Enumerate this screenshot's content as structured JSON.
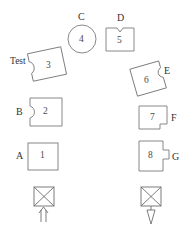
{
  "diagram": {
    "type": "schematic-block-diagram",
    "canvas": {
      "width": 188,
      "height": 229
    },
    "stroke_color": "#7a7a7a",
    "text_color": "#3a3a3a",
    "background_color": "#ffffff",
    "shapes": [
      {
        "id": "shape-1",
        "number": "1",
        "form": "square",
        "label": "A",
        "label_position": "left",
        "x": 28,
        "y": 143,
        "width": 30,
        "height": 27
      },
      {
        "id": "shape-2",
        "number": "2",
        "form": "rect-with-left-round-notch",
        "label": "B",
        "label_position": "left",
        "x": 28,
        "y": 98,
        "width": 34,
        "height": 28
      },
      {
        "id": "shape-3",
        "number": "3",
        "form": "rotated-rect-with-left-notch",
        "label": "Test",
        "label_position": "left",
        "x": 30,
        "y": 50,
        "width": 34,
        "height": 28,
        "rotation": -12
      },
      {
        "id": "shape-4",
        "number": "4",
        "form": "circle",
        "label": "C",
        "label_position": "top",
        "x": 68,
        "y": 25,
        "width": 28,
        "height": 28
      },
      {
        "id": "shape-5",
        "number": "5",
        "form": "rect-with-top-notch",
        "label": "D",
        "label_position": "top",
        "x": 106,
        "y": 27,
        "width": 28,
        "height": 24
      },
      {
        "id": "shape-6",
        "number": "6",
        "form": "rotated-rect-with-right-notch",
        "label": "E",
        "label_position": "right",
        "x": 133,
        "y": 64,
        "width": 34,
        "height": 28,
        "rotation": -16
      },
      {
        "id": "shape-7",
        "number": "7",
        "form": "rect-with-bottom-right-notch",
        "label": "F",
        "label_position": "right",
        "x": 139,
        "y": 106,
        "width": 28,
        "height": 23
      },
      {
        "id": "shape-8",
        "number": "8",
        "form": "rect-with-right-tab",
        "label": "G",
        "label_position": "right",
        "x": 139,
        "y": 141,
        "width": 28,
        "height": 30
      }
    ],
    "terminals": [
      {
        "id": "terminal-left",
        "symbol": "crossed-box",
        "arrow_direction": "up",
        "arrow_style": "double-line-into-box",
        "x": 34,
        "y": 187,
        "width": 20,
        "height": 19
      },
      {
        "id": "terminal-right",
        "symbol": "crossed-box",
        "arrow_direction": "down",
        "arrow_style": "solid-head-out-of-box",
        "x": 141,
        "y": 187,
        "width": 20,
        "height": 19
      }
    ]
  }
}
